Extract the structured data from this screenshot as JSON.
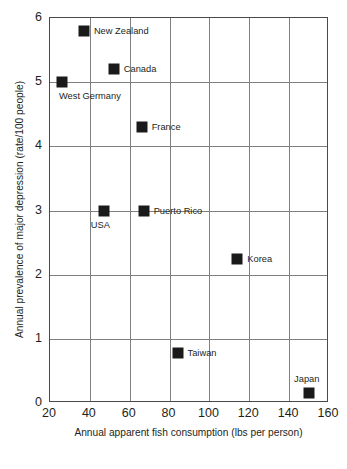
{
  "chart_data": {
    "type": "scatter",
    "title": "",
    "xlabel": "Annual apparent fish consumption (lbs per person)",
    "ylabel": "Annual prevalence of major depression (rate/100 people)",
    "xlim": [
      20,
      160
    ],
    "ylim": [
      0,
      6
    ],
    "xticks": [
      20,
      40,
      60,
      80,
      100,
      120,
      140,
      160
    ],
    "yticks": [
      0,
      1,
      2,
      3,
      4,
      5,
      6
    ],
    "xtick_labels": [
      "20",
      "40",
      "60",
      "80",
      "100",
      "120",
      "140",
      "160"
    ],
    "ytick_labels": [
      "0",
      "1",
      "2",
      "3",
      "4",
      "5",
      "6"
    ],
    "grid": "both",
    "legend": "none",
    "marker_color": "#1a1a1a",
    "marker_shape": "square",
    "points": [
      {
        "label": "New Zealand",
        "x": 37,
        "y": 5.8,
        "label_pos": "right"
      },
      {
        "label": "Canada",
        "x": 52,
        "y": 5.2,
        "label_pos": "right"
      },
      {
        "label": "West Germany",
        "x": 26,
        "y": 5.0,
        "label_pos": "below-right"
      },
      {
        "label": "France",
        "x": 66,
        "y": 4.3,
        "label_pos": "right"
      },
      {
        "label": "USA",
        "x": 47,
        "y": 3.0,
        "label_pos": "below"
      },
      {
        "label": "Puerto Rico",
        "x": 67,
        "y": 3.0,
        "label_pos": "right"
      },
      {
        "label": "Korea",
        "x": 114,
        "y": 2.25,
        "label_pos": "right"
      },
      {
        "label": "Taiwan",
        "x": 84,
        "y": 0.78,
        "label_pos": "right"
      },
      {
        "label": "Japan",
        "x": 150,
        "y": 0.15,
        "label_pos": "above"
      }
    ]
  }
}
